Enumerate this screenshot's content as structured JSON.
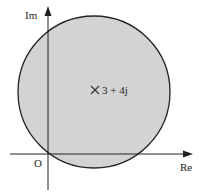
{
  "diagram": {
    "type": "argand-plane-region",
    "axes": {
      "real_label": "Re",
      "imag_label": "Im",
      "origin_label": "O"
    },
    "region": {
      "shape": "circle",
      "fill_color": "#d3d3d3",
      "stroke_color": "#222222"
    },
    "center_marker": {
      "symbol": "×",
      "label": "3 + 4j"
    }
  }
}
